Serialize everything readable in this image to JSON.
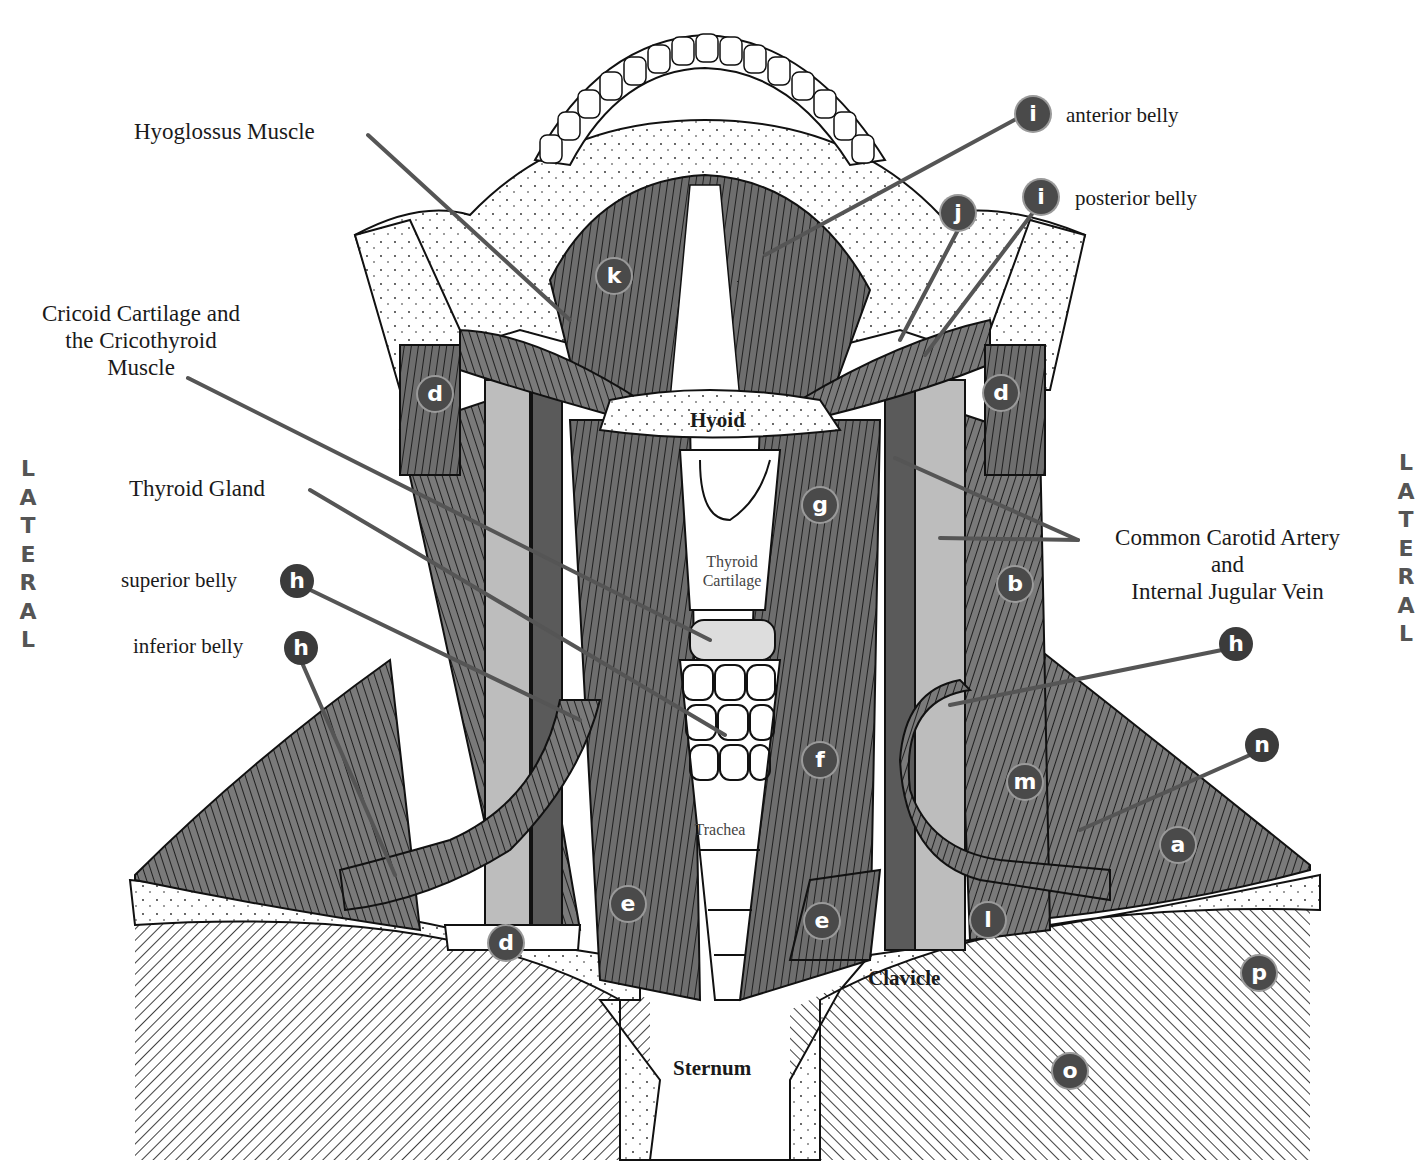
{
  "diagram": {
    "lateral_left": [
      "L",
      "A",
      "T",
      "E",
      "R",
      "A",
      "L"
    ],
    "lateral_right": [
      "L",
      "A",
      "T",
      "E",
      "R",
      "A",
      "L"
    ],
    "labels": {
      "hyoglossus": "Hyoglossus Muscle",
      "cricoid_1": "Cricoid Cartilage and",
      "cricoid_2": "the Cricothyroid",
      "cricoid_3": "Muscle",
      "thyroid_gland": "Thyroid Gland",
      "superior_belly": "superior belly",
      "inferior_belly": "inferior belly",
      "anterior_belly": "anterior belly",
      "posterior_belly": "posterior belly",
      "carotid_1": "Common Carotid Artery",
      "carotid_2": "and",
      "carotid_3": "Internal Jugular Vein",
      "hyoid": "Hyoid",
      "thyroid_cartilage_1": "Thyroid",
      "thyroid_cartilage_2": "Cartilage",
      "trachea": "Trachea",
      "clavicle": "Clavicle",
      "sternum": "Sternum"
    },
    "badges": [
      {
        "letter": "i",
        "x": 1016,
        "y": 97
      },
      {
        "letter": "i",
        "x": 1024,
        "y": 180
      },
      {
        "letter": "j",
        "x": 941,
        "y": 196
      },
      {
        "letter": "k",
        "x": 597,
        "y": 259
      },
      {
        "letter": "d",
        "x": 418,
        "y": 377
      },
      {
        "letter": "d",
        "x": 984,
        "y": 376
      },
      {
        "letter": "g",
        "x": 803,
        "y": 488
      },
      {
        "letter": "b",
        "x": 998,
        "y": 567
      },
      {
        "letter": "h",
        "x": 280,
        "y": 564
      },
      {
        "letter": "h",
        "x": 284,
        "y": 631
      },
      {
        "letter": "h",
        "x": 1219,
        "y": 627
      },
      {
        "letter": "n",
        "x": 1245,
        "y": 728
      },
      {
        "letter": "f",
        "x": 803,
        "y": 743
      },
      {
        "letter": "m",
        "x": 1008,
        "y": 765
      },
      {
        "letter": "a",
        "x": 1161,
        "y": 828
      },
      {
        "letter": "e",
        "x": 611,
        "y": 887
      },
      {
        "letter": "e",
        "x": 805,
        "y": 904
      },
      {
        "letter": "l",
        "x": 971,
        "y": 903
      },
      {
        "letter": "d",
        "x": 489,
        "y": 926
      },
      {
        "letter": "p",
        "x": 1242,
        "y": 956
      },
      {
        "letter": "o",
        "x": 1053,
        "y": 1054
      }
    ]
  }
}
